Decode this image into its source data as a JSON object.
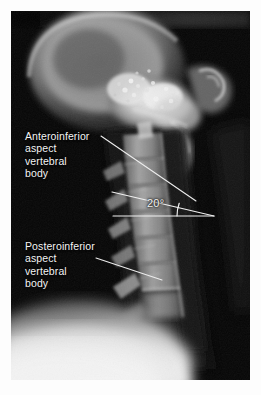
{
  "figure": {
    "modality": "radiograph",
    "background_color": "#ffffff",
    "plate_color": "#050505",
    "annotation_color": "#f4f4f4"
  },
  "annotations": {
    "anteroinferior": {
      "name": "anteroinferior-aspect-vertebral-body",
      "line1": "Anteroinferior",
      "line2": "aspect",
      "line3": "vertebral",
      "line4": "body"
    },
    "posteroinferior": {
      "name": "posteroinferior-aspect-vertebral-body",
      "line1": "Posteroinferior",
      "line2": "aspect",
      "line3": "vertebral",
      "line4": "body"
    },
    "angle": {
      "name": "vertebral-angle-measurement",
      "value": "20",
      "unit": "°",
      "display": "20°"
    }
  },
  "leader_lines": [
    {
      "name": "leader-line-anteroinferior",
      "x1": 101,
      "y1": 136,
      "x2": 196,
      "y2": 201,
      "color": "#ececec"
    },
    {
      "name": "leader-line-posteroinferior",
      "x1": 96,
      "y1": 258,
      "x2": 162,
      "y2": 280,
      "color": "#ececec"
    }
  ],
  "measurement_lines": [
    {
      "name": "horizontal-reference-line",
      "x1": 113,
      "y1": 216,
      "x2": 214,
      "y2": 216,
      "color": "#f0f0f0"
    },
    {
      "name": "vertebral-endplate-line",
      "x1": 112,
      "y1": 192,
      "x2": 214,
      "y2": 216,
      "color": "#f0f0f0"
    },
    {
      "name": "angle-arc",
      "cx": 214,
      "cy": 216,
      "radius": 37,
      "color": "#f0f0f0"
    }
  ],
  "anatomy": [
    {
      "name": "skull-occiput",
      "label": "Skull / occipital bone"
    },
    {
      "name": "skull-base",
      "label": "Skull base / mastoid"
    },
    {
      "name": "mandible-ramus",
      "label": "Mandibular ramus"
    },
    {
      "name": "cervical-vertebrae",
      "label": "Cervical vertebral bodies C1-C7"
    },
    {
      "name": "spinous-processes",
      "label": "Spinous processes"
    },
    {
      "name": "soft-tissue-shoulder",
      "label": "Shoulder soft tissue"
    },
    {
      "name": "airway-column",
      "label": "Prevertebral airway column"
    }
  ]
}
